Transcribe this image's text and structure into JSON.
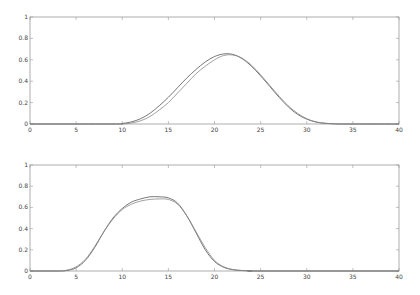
{
  "chart_data": [
    {
      "type": "line",
      "title": "",
      "xlabel": "",
      "ylabel": "",
      "xlim": [
        0,
        40
      ],
      "ylim": [
        0,
        1
      ],
      "grid": false,
      "xticks": [
        "0",
        "5",
        "10",
        "15",
        "20",
        "25",
        "30",
        "35",
        "40"
      ],
      "yticks": [
        "0",
        "0.2",
        "0.4",
        "0.6",
        "0.8",
        "1"
      ],
      "x": [
        0,
        9,
        10,
        11,
        12,
        13,
        14,
        15,
        16,
        17,
        18,
        19,
        20,
        21,
        22,
        23,
        24,
        25,
        26,
        27,
        28,
        29,
        30,
        31,
        32,
        33,
        34,
        40
      ],
      "series": [
        {
          "name": "curve-a",
          "values": [
            0,
            0,
            0.005,
            0.02,
            0.05,
            0.1,
            0.17,
            0.25,
            0.34,
            0.43,
            0.51,
            0.58,
            0.63,
            0.655,
            0.65,
            0.61,
            0.54,
            0.45,
            0.35,
            0.25,
            0.16,
            0.09,
            0.045,
            0.018,
            0.006,
            0.002,
            0,
            0
          ]
        },
        {
          "name": "curve-b",
          "values": [
            0,
            0,
            0.0,
            0.01,
            0.03,
            0.07,
            0.13,
            0.2,
            0.29,
            0.38,
            0.47,
            0.54,
            0.6,
            0.64,
            0.645,
            0.615,
            0.55,
            0.46,
            0.36,
            0.26,
            0.17,
            0.1,
            0.05,
            0.02,
            0.007,
            0.002,
            0,
            0
          ]
        }
      ]
    },
    {
      "type": "line",
      "title": "",
      "xlabel": "",
      "ylabel": "",
      "xlim": [
        0,
        40
      ],
      "ylim": [
        0,
        1
      ],
      "grid": false,
      "xticks": [
        "0",
        "5",
        "10",
        "15",
        "20",
        "25",
        "30",
        "35",
        "40"
      ],
      "yticks": [
        "0",
        "0.2",
        "0.4",
        "0.6",
        "0.8",
        "1"
      ],
      "x": [
        0,
        3,
        4,
        5,
        6,
        7,
        8,
        9,
        10,
        11,
        12,
        13,
        14,
        15,
        16,
        17,
        18,
        19,
        20,
        21,
        22,
        23,
        24,
        25,
        40
      ],
      "series": [
        {
          "name": "curve-a",
          "values": [
            0,
            0,
            0.005,
            0.03,
            0.1,
            0.22,
            0.37,
            0.5,
            0.59,
            0.65,
            0.68,
            0.7,
            0.7,
            0.69,
            0.64,
            0.52,
            0.36,
            0.2,
            0.09,
            0.035,
            0.012,
            0.004,
            0.001,
            0,
            0
          ]
        },
        {
          "name": "curve-b",
          "values": [
            0,
            0,
            0.008,
            0.04,
            0.11,
            0.23,
            0.37,
            0.49,
            0.58,
            0.63,
            0.66,
            0.675,
            0.68,
            0.675,
            0.63,
            0.52,
            0.37,
            0.22,
            0.1,
            0.04,
            0.014,
            0.005,
            0.001,
            0,
            0
          ]
        }
      ]
    }
  ]
}
